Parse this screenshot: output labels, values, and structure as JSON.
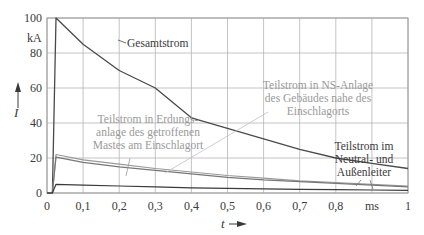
{
  "chart_data": {
    "type": "line",
    "title": "",
    "xlabel": "t",
    "ylabel": "I",
    "x_unit": "ms",
    "y_unit": "kA",
    "xlim": [
      0,
      1
    ],
    "ylim": [
      0,
      100
    ],
    "grid": true,
    "x_ticks": [
      "0",
      "0,1",
      "0,2",
      "0,3",
      "0,4",
      "0,5",
      "0,6",
      "0,7",
      "0,8",
      "ms",
      "1"
    ],
    "y_ticks": [
      "0",
      "20",
      "40",
      "60",
      "80",
      "100"
    ],
    "x": [
      0,
      0.015,
      0.025,
      0.1,
      0.2,
      0.3,
      0.4,
      0.5,
      0.6,
      0.7,
      0.8,
      0.9,
      1.0
    ],
    "series": [
      {
        "name": "Gesamtstrom",
        "color": "#4a4a4a",
        "values": [
          0,
          0,
          100,
          85,
          70,
          60,
          43,
          37,
          31,
          25,
          20,
          17,
          14
        ]
      },
      {
        "name": "Teilstrom in NS-Anlage des Gebäudes nahe des Einschlagorts",
        "color": "#9a9a9a",
        "values": [
          0,
          0,
          22,
          19,
          16.5,
          14,
          12,
          10,
          8.5,
          7,
          6,
          5,
          4
        ]
      },
      {
        "name": "Teilstrom in Erdungsanlage des getroffenen Mastes am Einschlagort",
        "color": "#777777",
        "values": [
          0,
          0,
          20.5,
          17.5,
          15,
          13,
          11,
          9,
          7.5,
          6.5,
          5.5,
          4.5,
          3.5
        ]
      },
      {
        "name": "Teilstrom im Neutral- und Außenleiter",
        "color": "#3a3a3a",
        "values": [
          0,
          0,
          5,
          4.5,
          4,
          3.5,
          3,
          2.7,
          2.4,
          2.1,
          1.9,
          1.7,
          1.5
        ]
      }
    ],
    "annotations": [
      {
        "text": [
          "Gesamtstrom"
        ],
        "target": "Gesamtstrom"
      },
      {
        "text": [
          "Teilstrom in NS-Anlage",
          "des Gebäudes nahe des",
          "Einschlagorts"
        ],
        "target": "Teilstrom in NS-Anlage"
      },
      {
        "text": [
          "Teilstrom in Erdungs-",
          "anlage des getroffenen",
          "Mastes am Einschlagort"
        ],
        "target": "Teilstrom in Erdungsanlage"
      },
      {
        "text": [
          "Teilstrom im",
          "Neutral- und",
          "Außenleiter"
        ],
        "target": "Teilstrom im Neutral- und Außenleiter"
      }
    ]
  },
  "labels": {
    "y_unit": "kA",
    "y_axis": "I",
    "x_axis": "t",
    "gesamt": "Gesamtstrom",
    "ns_1": "Teilstrom in NS-Anlage",
    "ns_2": "des Gebäudes nahe des",
    "ns_3": "Einschlagorts",
    "erd_1": "Teilstrom in Erdungs-",
    "erd_2": "anlage des getroffenen",
    "erd_3": "Mastes am Einschlagort",
    "nl_1": "Teilstrom im",
    "nl_2": "Neutral- und",
    "nl_3": "Außenleiter"
  }
}
